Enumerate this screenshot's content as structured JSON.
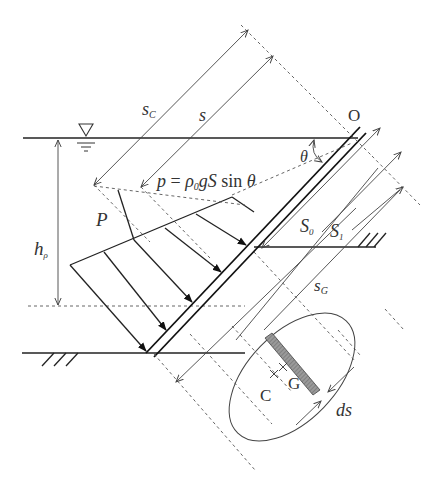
{
  "figure": {
    "colors": {
      "line": "#222222",
      "dashed": "#555555",
      "hatched_strip": "#888888",
      "text": "#333333",
      "background": "#ffffff"
    }
  },
  "labels": {
    "origin": "O",
    "s_c": "s",
    "s_c_sub": "C",
    "s": "s",
    "pressure_formula_p": "p",
    "pressure_formula_eq": " = ",
    "pressure_formula_rho": "ρ",
    "pressure_formula_rho_sub": "0",
    "pressure_formula_g": "g",
    "pressure_formula_S": "S",
    "pressure_formula_sin": " sin ",
    "pressure_formula_theta": "θ",
    "theta": "θ",
    "depth_h": "h",
    "depth_h_sub": "ρ",
    "total_force": "P",
    "area_S0": "S",
    "area_S0_sub": "0",
    "area_S1": "S",
    "area_S1_sub": "1",
    "s_G": "s",
    "s_G_sub": "G",
    "centroid_C": "C",
    "centroid_G": "G",
    "strip_width": "ds"
  },
  "icons": {
    "free_surface": "∇"
  }
}
